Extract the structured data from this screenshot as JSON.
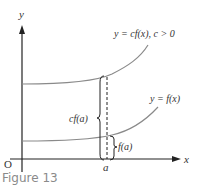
{
  "figure": {
    "caption": "Figure 13",
    "axes": {
      "y_label": "y",
      "x_label": "x",
      "origin_label": "O",
      "a_label": "a"
    },
    "curves": [
      {
        "name": "scaled",
        "label": "y = cf(x),  c > 0"
      },
      {
        "name": "base",
        "label": "y = f(x)"
      }
    ],
    "annotations": {
      "cf_a": "cf(a)",
      "f_a": "f(a)"
    },
    "colors": {
      "axis": "#222222",
      "curve": "#8a8a8a",
      "text": "#333333",
      "caption": "#8a8a8a"
    }
  }
}
